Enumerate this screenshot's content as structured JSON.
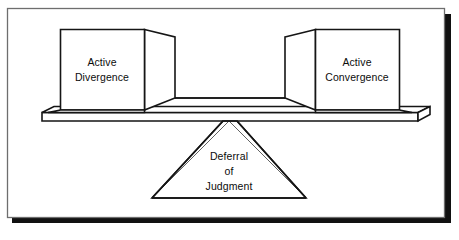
{
  "figure": {
    "title": "Deferral of Judgment balance diagram",
    "frame": {
      "border_color": "#6e6e6e",
      "shadow_color": "#111111",
      "background_color": "#ffffff"
    },
    "line_color": "#151515",
    "accent_thin_line_color": "#3a3a3a"
  },
  "left_block": {
    "label_line1": "Active",
    "label_line2": "Divergence",
    "name": "Active Divergence"
  },
  "right_block": {
    "label_line1": "Active",
    "label_line2": "Convergence",
    "name": "Active Convergence"
  },
  "fulcrum": {
    "label_line1": "Deferral",
    "label_line2": "of",
    "label_line3": "Judgment",
    "name": "Deferral of Judgment"
  },
  "beam": {
    "name": "balance-beam"
  }
}
